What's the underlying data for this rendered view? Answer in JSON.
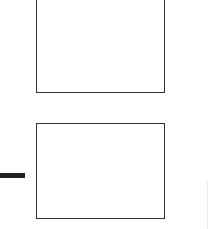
{
  "diagram": {
    "nodes": [
      {
        "id": "box-top",
        "label": "",
        "x": 36,
        "y": -2,
        "width": 129,
        "height": 95
      },
      {
        "id": "box-bottom",
        "label": "",
        "x": 36,
        "y": 123,
        "width": 129,
        "height": 96
      }
    ],
    "connectors": [
      {
        "id": "connector-left",
        "x": 0,
        "y": 173,
        "width": 25,
        "height": 5,
        "color": "#222222"
      }
    ],
    "colors": {
      "stroke": "#333333",
      "background": "#ffffff"
    }
  }
}
